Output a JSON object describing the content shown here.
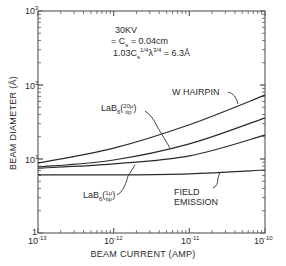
{
  "chart_data": {
    "type": "line",
    "title": "",
    "xlabel": "BEAM CURRENT (AMP)",
    "ylabel": "BEAM DIAMETER (Å)",
    "xscale": "log",
    "yscale": "log",
    "xlim": [
      1e-13,
      1e-10
    ],
    "ylim": [
      1,
      1000
    ],
    "x_tick_labels": [
      "10-13",
      "10-12",
      "10-11",
      "10-10"
    ],
    "y_tick_labels": [
      "1",
      "101",
      "102",
      "103"
    ],
    "grid": false,
    "annotations": [
      "30KV",
      "= Cs = 0.04cm",
      "1.03Cs1/4 λ3/4 = 6.3Å"
    ],
    "x": [
      1e-13,
      1e-12,
      1e-11,
      1e-10
    ],
    "series": [
      {
        "name": "W HAIRPIN",
        "values": [
          8.8,
          14,
          29,
          73
        ]
      },
      {
        "name": "LaB6 (20μ tip)",
        "values": [
          7.8,
          9.7,
          16,
          36
        ]
      },
      {
        "name": "LaB6 (1μ tip)",
        "values": [
          7.5,
          8.6,
          11,
          21
        ]
      },
      {
        "name": "FIELD EMISSION",
        "values": [
          6.1,
          6.1,
          6.3,
          7.1
        ]
      }
    ]
  },
  "labels": {
    "kv": "30KV",
    "cs": "= C",
    "cs_sub": "s",
    "cs_val": " = 0.04cm",
    "formula_a": "1.03C",
    "formula_s": "s",
    "formula_exp1": "1/4",
    "formula_lambda": "λ",
    "formula_exp2": "3/4",
    "formula_val": " = 6.3Å",
    "w_hairpin": "W HAIRPIN",
    "lab6": "LaB",
    "lab6_sub": "6",
    "lab6_20_top": "20μ",
    "lab6_20_bot": "tip",
    "lab6_1_top": "1μ",
    "lab6_1_bot": "tip",
    "field": "FIELD",
    "emission": "EMISSION"
  },
  "ticks": {
    "y3_base": "10",
    "y3_exp": "3",
    "y2_base": "10",
    "y2_exp": "2",
    "y1_base": "10",
    "y1_exp": "1",
    "y0": "1",
    "x13_base": "10",
    "x13_exp": "-13",
    "x12_base": "10",
    "x12_exp": "-12",
    "x11_base": "10",
    "x11_exp": "-11",
    "x10_base": "10",
    "x10_exp": "-10"
  }
}
